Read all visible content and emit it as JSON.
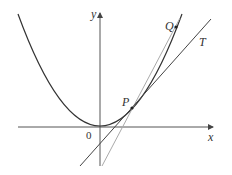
{
  "diagram": {
    "title": "",
    "labels": {
      "y_axis": "y",
      "x_axis": "x",
      "origin": "0",
      "point_p": "P",
      "point_q": "Q",
      "tangent": "T"
    },
    "elements": [
      "parabola y = x^2",
      "tangent line T at P",
      "secant line PQ",
      "point P",
      "point Q"
    ],
    "colors": {
      "curve": "#333333",
      "axes": "#444444",
      "tangent": "#444444",
      "secant": "#aaaaaa"
    }
  }
}
